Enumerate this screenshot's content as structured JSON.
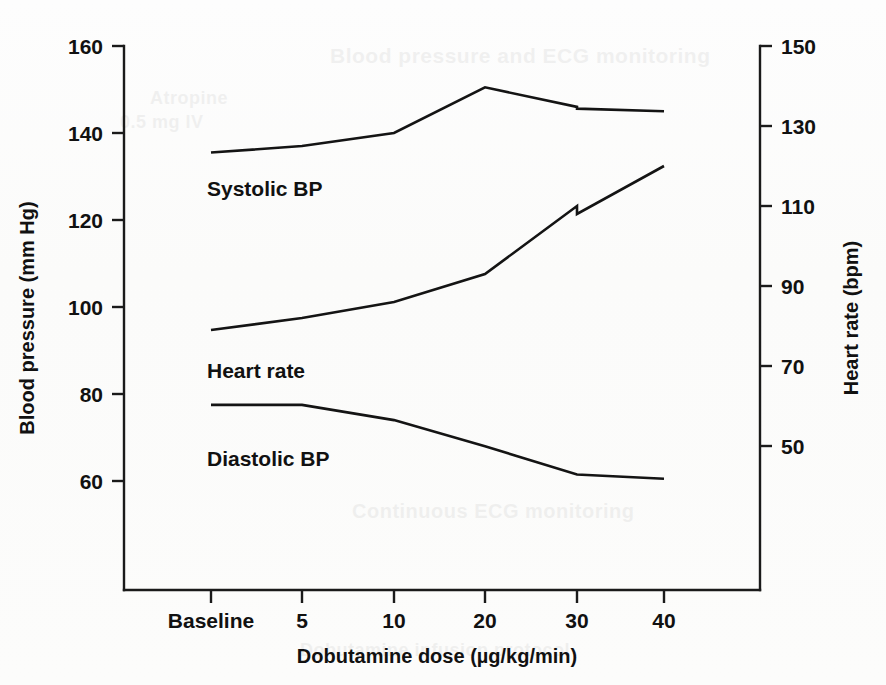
{
  "figure": {
    "background_color": "#ffffff",
    "line_color": "#141414"
  },
  "left_axis": {
    "title": "Blood pressure (mm Hg)",
    "ticks": [
      "160",
      "140",
      "120",
      "100",
      "80",
      "60"
    ],
    "values": [
      160,
      140,
      120,
      100,
      80,
      60
    ],
    "min": 48,
    "max": 160
  },
  "right_axis": {
    "title": "Heart rate (bpm)",
    "ticks": [
      "150",
      "130",
      "110",
      "90",
      "70",
      "50"
    ],
    "values": [
      150,
      130,
      110,
      90,
      70,
      50
    ],
    "min": 38,
    "max": 150
  },
  "x_axis": {
    "title": "Dobutamine dose (µg/kg/min)",
    "ticks": [
      "Baseline",
      "5",
      "10",
      "20",
      "30",
      "40"
    ]
  },
  "series_labels": {
    "systolic": "Systolic BP",
    "heart_rate": "Heart rate",
    "diastolic": "Diastolic BP"
  },
  "ghost_text": {
    "t1": "Blood pressure and ECG monitoring",
    "t2": "Atropine",
    "t3": "0.5 mg IV",
    "t4": "Continuous ECG monitoring",
    "t5": "Dobutamine infusion protocol"
  },
  "chart_data": {
    "type": "line",
    "title": "",
    "xlabel": "Dobutamine dose (µg/kg/min)",
    "ylabel": "Blood pressure (mm Hg)",
    "y2label": "Heart rate (bpm)",
    "categories": [
      "Baseline",
      "5",
      "10",
      "20",
      "30",
      "40"
    ],
    "x": [
      0,
      5,
      10,
      20,
      30,
      40
    ],
    "ylim": [
      48,
      160
    ],
    "y2lim": [
      38,
      150
    ],
    "grid": false,
    "legend": "inline-labels",
    "series": [
      {
        "name": "Systolic BP",
        "axis": "left",
        "unit": "mm Hg",
        "values": [
          135.5,
          137.0,
          140.0,
          150.5,
          146.0,
          145.0
        ],
        "note": "small step discontinuity at 30 µg/kg/min: 146.0 drops to 145.6",
        "step_at_30": {
          "before": 146.0,
          "after": 145.6
        }
      },
      {
        "name": "Heart rate",
        "axis": "right",
        "unit": "bpm",
        "values": [
          79.0,
          82.0,
          86.0,
          93.0,
          110.0,
          120.0
        ],
        "note": "small step discontinuity at 30 µg/kg/min: 110 drops to 108",
        "step_at_30": {
          "before": 110.0,
          "after": 108.0
        }
      },
      {
        "name": "Diastolic BP",
        "axis": "left",
        "unit": "mm Hg",
        "values": [
          77.5,
          77.5,
          74.0,
          68.0,
          61.5,
          60.5
        ]
      }
    ],
    "annotations": [
      {
        "text": "Systolic BP",
        "near_x": "Baseline",
        "axis": "left"
      },
      {
        "text": "Heart rate",
        "near_x": "Baseline",
        "axis": "right"
      },
      {
        "text": "Diastolic BP",
        "near_x": "Baseline",
        "axis": "left"
      }
    ]
  }
}
